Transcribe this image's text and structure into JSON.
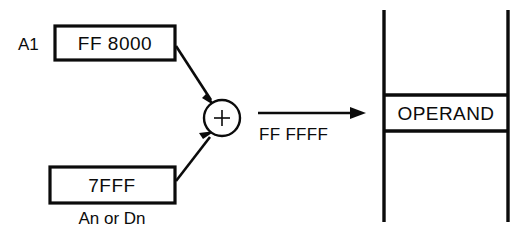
{
  "figure": {
    "source_operand_a": {
      "register_label": "A1",
      "value": "FF 8000"
    },
    "source_operand_b": {
      "value": "7FFF",
      "caption": "An or Dn"
    },
    "adder": {
      "symbol": "+",
      "name": "plus-sign"
    },
    "result_bus": {
      "value": "FF FFFF",
      "arrow": "right-arrow-icon"
    },
    "memory": {
      "cell_label": "OPERAND"
    },
    "colors": {
      "ink": "#0b0b0b",
      "background": "#ffffff"
    }
  }
}
